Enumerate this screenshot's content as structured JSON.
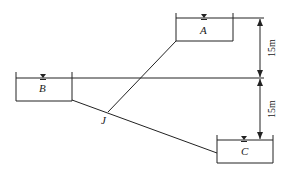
{
  "diagram": {
    "type": "three-reservoir pipe network",
    "reservoirs": [
      {
        "id": "A",
        "label": "A"
      },
      {
        "id": "B",
        "label": "B"
      },
      {
        "id": "C",
        "label": "C"
      }
    ],
    "junction": {
      "label": "J"
    },
    "dimensions": [
      {
        "label": "15m",
        "between": [
          "A",
          "B"
        ]
      },
      {
        "label": "15m",
        "between": [
          "B",
          "C"
        ]
      }
    ],
    "water_surface_symbol": "▽"
  },
  "colors": {
    "line": "#222222",
    "background": "#ffffff"
  }
}
